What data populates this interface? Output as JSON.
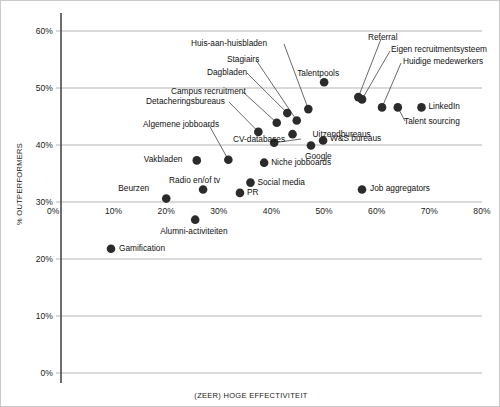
{
  "chart_data": {
    "type": "scatter",
    "title": "",
    "xlabel": "(ZEER) HOGE EFFECTIVITEIT",
    "ylabel": "% OUTPERFORMERS",
    "xlim": [
      0,
      80
    ],
    "ylim": [
      0,
      60
    ],
    "xticks": [
      "0%",
      "10%",
      "20%",
      "30%",
      "40%",
      "50%",
      "60%",
      "70%",
      "80%"
    ],
    "xtick_values": [
      0,
      10,
      20,
      30,
      40,
      50,
      60,
      70,
      80
    ],
    "yticks": [
      "0%",
      "10%",
      "20%",
      "30%",
      "40%",
      "50%",
      "60%"
    ],
    "ytick_values": [
      0,
      10,
      20,
      30,
      40,
      50,
      60
    ],
    "grid": "horizontal",
    "legend": "none",
    "axis_note": "x-axis tick labels are drawn floating at the 30% gridline",
    "marker_color": "#2b2b2b",
    "grid_color": "#b5b5b5",
    "axis_color": "#4a4a4a",
    "points": [
      {
        "label": "Gamification",
        "x": 9.5,
        "y": 21.8,
        "label_pos": "right"
      },
      {
        "label": "Beurzen",
        "x": 20.0,
        "y": 30.6,
        "label_pos": "left"
      },
      {
        "label": "Alumni-activiteiten",
        "x": 25.5,
        "y": 26.9,
        "label_pos": "below"
      },
      {
        "label": "Radio en/of tv",
        "x": 27.0,
        "y": 32.2,
        "label_pos": "above"
      },
      {
        "label": "Vakbladen",
        "x": 25.8,
        "y": 37.3,
        "label_pos": "left"
      },
      {
        "label": "PR",
        "x": 34.0,
        "y": 31.6,
        "label_pos": "right"
      },
      {
        "label": "Social media",
        "x": 36.0,
        "y": 33.4,
        "label_pos": "right"
      },
      {
        "label": "Niche jobboards",
        "x": 38.6,
        "y": 36.9,
        "label_pos": "right"
      },
      {
        "label": "Algemene jobboards",
        "x": 31.8,
        "y": 37.4,
        "label_pos": "leader"
      },
      {
        "label": "CV-databases",
        "x": 40.5,
        "y": 40.4,
        "label_pos": "leader"
      },
      {
        "label": "Detacheringsbureaus",
        "x": 37.5,
        "y": 42.3,
        "label_pos": "leader"
      },
      {
        "label": "Campus recruitment",
        "x": 41.0,
        "y": 43.9,
        "label_pos": "leader"
      },
      {
        "label": "Dagbladen",
        "x": 43.0,
        "y": 45.6,
        "label_pos": "leader"
      },
      {
        "label": "Stagiairs",
        "x": 44.8,
        "y": 44.3,
        "label_pos": "leader"
      },
      {
        "label": "Huis-aan-huisbladen",
        "x": 47.0,
        "y": 46.3,
        "label_pos": "leader"
      },
      {
        "label": "Uitzendbureaus",
        "x": 44.0,
        "y": 41.9,
        "label_pos": "right"
      },
      {
        "label": "Google",
        "x": 47.5,
        "y": 39.9,
        "label_pos": "below"
      },
      {
        "label": "W&S bureaus",
        "x": 49.8,
        "y": 40.8,
        "label_pos": "right"
      },
      {
        "label": "Talentpools",
        "x": 50.0,
        "y": 51.0,
        "label_pos": "above"
      },
      {
        "label": "Referral",
        "x": 56.5,
        "y": 48.4,
        "label_pos": "leader"
      },
      {
        "label": "Eigen recruitmentsysteem",
        "x": 57.2,
        "y": 48.0,
        "label_pos": "leader"
      },
      {
        "label": "Huidige medewerkers",
        "x": 61.0,
        "y": 46.6,
        "label_pos": "leader"
      },
      {
        "label": "Talent sourcing",
        "x": 64.0,
        "y": 46.6,
        "label_pos": "leader"
      },
      {
        "label": "LinkedIn",
        "x": 68.5,
        "y": 46.6,
        "label_pos": "right"
      },
      {
        "label": "Job aggregators",
        "x": 57.2,
        "y": 32.2,
        "label_pos": "right"
      }
    ]
  }
}
